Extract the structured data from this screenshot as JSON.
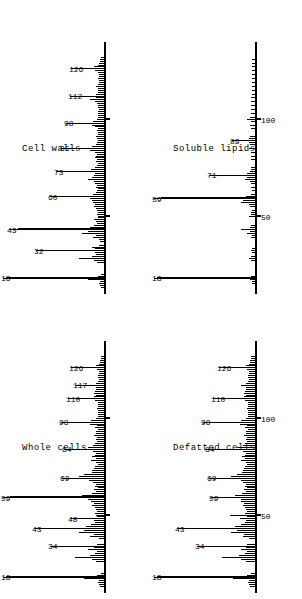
{
  "figure": {
    "caption_present": false,
    "panel_count": 4,
    "orientation": "rotated-90-ccw",
    "ink_color": "#000000",
    "background_color": "#ffffff"
  },
  "panels": [
    {
      "id": "whole-cells",
      "title": "Whole cells",
      "grid_position": "left-bottom",
      "axis_tick_labels": [],
      "labeled_peaks": [
        "18",
        "34",
        "43",
        "48",
        "59",
        "69",
        "84",
        "98",
        "110",
        "117",
        "126"
      ]
    },
    {
      "id": "cell-walls",
      "title": "Cell walls",
      "grid_position": "left-top",
      "axis_tick_labels": [],
      "labeled_peaks": [
        "18",
        "32",
        "43",
        "60",
        "73",
        "85",
        "98",
        "112",
        "126"
      ]
    },
    {
      "id": "defatted-cells",
      "title": "Defatted cells",
      "grid_position": "right-bottom",
      "axis_tick_labels": [
        "50",
        "100"
      ],
      "labeled_peaks": [
        "18",
        "34",
        "43",
        "59",
        "69",
        "84",
        "98",
        "110",
        "126"
      ]
    },
    {
      "id": "soluble-lipids",
      "title": "Soluble lipids",
      "grid_position": "right-top",
      "axis_tick_labels": [
        "50",
        "100"
      ],
      "labeled_peaks": [
        "18",
        "59",
        "71",
        "89"
      ]
    }
  ],
  "chart_data": [
    {
      "type": "bar",
      "id": "whole-cells",
      "title": "Whole cells",
      "xlabel": "m/z",
      "ylabel": "Relative intensity",
      "xlim": [
        10,
        135
      ],
      "ylim": [
        0,
        100
      ],
      "grid": false,
      "legend": "none",
      "ticks": [
        50,
        100
      ],
      "tick_labels": [
        "",
        ""
      ],
      "annotations": [
        {
          "mz": 18,
          "label": "18"
        },
        {
          "mz": 34,
          "label": "34"
        },
        {
          "mz": 43,
          "label": "43"
        },
        {
          "mz": 48,
          "label": "48"
        },
        {
          "mz": 59,
          "label": "59"
        },
        {
          "mz": 69,
          "label": "69"
        },
        {
          "mz": 84,
          "label": "84"
        },
        {
          "mz": 98,
          "label": "98"
        },
        {
          "mz": 110,
          "label": "110"
        },
        {
          "mz": 117,
          "label": "117"
        },
        {
          "mz": 126,
          "label": "126"
        }
      ],
      "x": [
        13,
        14,
        15,
        16,
        17,
        18,
        19,
        20,
        26,
        27,
        28,
        29,
        30,
        31,
        32,
        33,
        34,
        35,
        38,
        39,
        40,
        41,
        42,
        43,
        44,
        45,
        46,
        47,
        48,
        49,
        50,
        51,
        52,
        53,
        54,
        55,
        56,
        57,
        58,
        59,
        60,
        61,
        62,
        63,
        64,
        65,
        66,
        67,
        68,
        69,
        70,
        71,
        72,
        73,
        74,
        75,
        76,
        77,
        78,
        79,
        80,
        81,
        82,
        83,
        84,
        85,
        86,
        87,
        88,
        89,
        90,
        91,
        92,
        93,
        94,
        95,
        96,
        97,
        98,
        99,
        100,
        101,
        102,
        103,
        104,
        105,
        106,
        107,
        108,
        109,
        110,
        111,
        112,
        113,
        114,
        115,
        116,
        117,
        118,
        119,
        120,
        121,
        122,
        123,
        124,
        125,
        126,
        127,
        128,
        129,
        130,
        131,
        132
      ],
      "y": [
        4,
        5,
        6,
        5,
        20,
        100,
        7,
        3,
        8,
        12,
        30,
        14,
        9,
        7,
        16,
        10,
        46,
        7,
        5,
        14,
        10,
        26,
        20,
        62,
        18,
        13,
        9,
        10,
        26,
        7,
        8,
        9,
        7,
        8,
        9,
        12,
        10,
        13,
        16,
        96,
        22,
        12,
        8,
        10,
        6,
        9,
        8,
        11,
        15,
        34,
        26,
        20,
        12,
        12,
        10,
        9,
        6,
        8,
        13,
        8,
        12,
        9,
        8,
        11,
        32,
        16,
        11,
        9,
        7,
        8,
        7,
        10,
        8,
        8,
        6,
        9,
        7,
        14,
        35,
        13,
        8,
        6,
        6,
        6,
        6,
        7,
        6,
        6,
        6,
        9,
        28,
        10,
        8,
        10,
        9,
        8,
        8,
        20,
        8,
        6,
        5,
        6,
        6,
        5,
        5,
        7,
        25,
        8,
        5,
        4,
        4,
        3,
        3
      ]
    },
    {
      "type": "bar",
      "id": "cell-walls",
      "title": "Cell walls",
      "xlabel": "m/z",
      "ylabel": "Relative intensity",
      "xlim": [
        10,
        135
      ],
      "ylim": [
        0,
        100
      ],
      "grid": false,
      "legend": "none",
      "ticks": [
        50,
        100
      ],
      "tick_labels": [
        "",
        ""
      ],
      "annotations": [
        {
          "mz": 18,
          "label": "18"
        },
        {
          "mz": 32,
          "label": "32"
        },
        {
          "mz": 43,
          "label": "43"
        },
        {
          "mz": 60,
          "label": "60"
        },
        {
          "mz": 73,
          "label": "73"
        },
        {
          "mz": 85,
          "label": "85"
        },
        {
          "mz": 98,
          "label": "98"
        },
        {
          "mz": 112,
          "label": "112"
        },
        {
          "mz": 126,
          "label": "126"
        }
      ],
      "x": [
        13,
        14,
        15,
        16,
        17,
        18,
        19,
        20,
        26,
        27,
        28,
        29,
        30,
        31,
        32,
        33,
        34,
        35,
        37,
        38,
        39,
        40,
        41,
        42,
        43,
        44,
        45,
        46,
        47,
        48,
        49,
        50,
        51,
        52,
        53,
        54,
        55,
        56,
        57,
        58,
        59,
        60,
        61,
        62,
        63,
        64,
        65,
        66,
        67,
        68,
        69,
        70,
        71,
        72,
        73,
        74,
        75,
        76,
        77,
        78,
        79,
        80,
        81,
        82,
        83,
        84,
        85,
        86,
        87,
        88,
        89,
        90,
        91,
        92,
        93,
        94,
        95,
        96,
        97,
        98,
        99,
        100,
        101,
        102,
        103,
        104,
        105,
        106,
        107,
        108,
        109,
        110,
        111,
        112,
        113,
        114,
        115,
        116,
        117,
        118,
        119,
        120,
        121,
        122,
        123,
        124,
        125,
        126,
        127,
        128,
        129,
        130,
        131,
        132
      ],
      "y": [
        3,
        4,
        5,
        4,
        16,
        100,
        6,
        3,
        7,
        10,
        26,
        12,
        8,
        9,
        60,
        9,
        12,
        5,
        4,
        5,
        11,
        8,
        22,
        16,
        88,
        14,
        10,
        7,
        8,
        10,
        6,
        6,
        7,
        6,
        7,
        8,
        10,
        9,
        11,
        12,
        14,
        46,
        11,
        8,
        7,
        6,
        8,
        7,
        9,
        10,
        16,
        12,
        10,
        9,
        40,
        13,
        9,
        7,
        6,
        8,
        7,
        9,
        8,
        7,
        9,
        14,
        34,
        12,
        8,
        7,
        6,
        7,
        8,
        6,
        6,
        7,
        6,
        9,
        12,
        30,
        11,
        7,
        6,
        6,
        6,
        6,
        5,
        6,
        6,
        7,
        9,
        14,
        8,
        26,
        8,
        6,
        6,
        6,
        8,
        6,
        5,
        5,
        6,
        5,
        5,
        6,
        9,
        24,
        10,
        6,
        5,
        4,
        4,
        3
      ]
    },
    {
      "type": "bar",
      "id": "defatted-cells",
      "title": "Defatted cells",
      "xlabel": "m/z",
      "ylabel": "Relative intensity",
      "xlim": [
        10,
        135
      ],
      "ylim": [
        0,
        100
      ],
      "grid": false,
      "legend": "none",
      "ticks": [
        50,
        100
      ],
      "tick_labels": [
        "50",
        "100"
      ],
      "annotations": [
        {
          "mz": 18,
          "label": "18"
        },
        {
          "mz": 34,
          "label": "34"
        },
        {
          "mz": 43,
          "label": "43"
        },
        {
          "mz": 59,
          "label": "59"
        },
        {
          "mz": 69,
          "label": "69"
        },
        {
          "mz": 84,
          "label": "84"
        },
        {
          "mz": 98,
          "label": "98"
        },
        {
          "mz": 110,
          "label": "110"
        },
        {
          "mz": 126,
          "label": "126"
        }
      ],
      "x": [
        13,
        14,
        15,
        16,
        17,
        18,
        19,
        20,
        26,
        27,
        28,
        29,
        30,
        31,
        32,
        33,
        34,
        35,
        38,
        39,
        40,
        41,
        42,
        43,
        44,
        45,
        46,
        47,
        48,
        49,
        50,
        51,
        52,
        53,
        54,
        55,
        56,
        57,
        58,
        59,
        60,
        61,
        62,
        63,
        64,
        65,
        66,
        67,
        68,
        69,
        70,
        71,
        72,
        73,
        74,
        75,
        76,
        77,
        78,
        79,
        80,
        81,
        82,
        83,
        84,
        85,
        86,
        87,
        88,
        89,
        90,
        91,
        92,
        93,
        94,
        95,
        96,
        97,
        98,
        99,
        100,
        101,
        102,
        103,
        104,
        105,
        106,
        107,
        108,
        109,
        110,
        111,
        112,
        113,
        114,
        115,
        116,
        117,
        118,
        119,
        120,
        121,
        122,
        123,
        124,
        125,
        126,
        127,
        128,
        129,
        130,
        131,
        132
      ],
      "y": [
        5,
        6,
        7,
        6,
        22,
        100,
        8,
        4,
        9,
        14,
        34,
        16,
        10,
        8,
        14,
        9,
        50,
        8,
        6,
        12,
        11,
        24,
        18,
        70,
        20,
        14,
        10,
        9,
        15,
        8,
        26,
        10,
        8,
        9,
        10,
        12,
        11,
        14,
        14,
        36,
        20,
        13,
        9,
        11,
        8,
        10,
        9,
        12,
        14,
        38,
        24,
        18,
        13,
        12,
        11,
        10,
        8,
        9,
        14,
        10,
        13,
        10,
        9,
        12,
        40,
        18,
        12,
        10,
        8,
        9,
        8,
        11,
        9,
        9,
        7,
        10,
        8,
        15,
        44,
        14,
        9,
        7,
        7,
        7,
        7,
        8,
        7,
        7,
        7,
        10,
        34,
        11,
        9,
        11,
        10,
        9,
        9,
        14,
        9,
        7,
        6,
        7,
        7,
        6,
        6,
        8,
        28,
        9,
        6,
        5,
        5,
        4,
        4
      ]
    },
    {
      "type": "bar",
      "id": "soluble-lipids",
      "title": "Soluble lipids",
      "xlabel": "m/z",
      "ylabel": "Relative intensity",
      "xlim": [
        10,
        135
      ],
      "ylim": [
        0,
        100
      ],
      "grid": false,
      "legend": "none",
      "ticks": [
        50,
        100
      ],
      "tick_labels": [
        "50",
        "100"
      ],
      "annotations": [
        {
          "mz": 18,
          "label": "18"
        },
        {
          "mz": 59,
          "label": "59"
        },
        {
          "mz": 71,
          "label": "71"
        },
        {
          "mz": 89,
          "label": "89"
        }
      ],
      "x": [
        15,
        16,
        17,
        18,
        19,
        27,
        28,
        29,
        31,
        32,
        33,
        39,
        40,
        41,
        42,
        43,
        44,
        45,
        50,
        51,
        52,
        53,
        55,
        56,
        57,
        58,
        59,
        60,
        61,
        63,
        65,
        67,
        68,
        69,
        70,
        71,
        72,
        73,
        74,
        75,
        79,
        81,
        83,
        85,
        87,
        88,
        89,
        90,
        91,
        95,
        97,
        99,
        100,
        101,
        103,
        105,
        107,
        109,
        111,
        113,
        115,
        117,
        119,
        121,
        123,
        125,
        127,
        129,
        131
      ],
      "y": [
        3,
        3,
        5,
        100,
        4,
        4,
        6,
        4,
        3,
        4,
        3,
        4,
        3,
        8,
        5,
        14,
        5,
        4,
        6,
        4,
        4,
        3,
        5,
        6,
        14,
        12,
        96,
        9,
        4,
        3,
        4,
        4,
        5,
        10,
        8,
        38,
        8,
        5,
        4,
        4,
        4,
        4,
        4,
        6,
        5,
        6,
        14,
        6,
        5,
        4,
        5,
        4,
        8,
        5,
        4,
        4,
        4,
        4,
        4,
        3,
        3,
        3,
        3,
        3,
        3,
        3,
        3,
        3,
        3
      ]
    }
  ]
}
